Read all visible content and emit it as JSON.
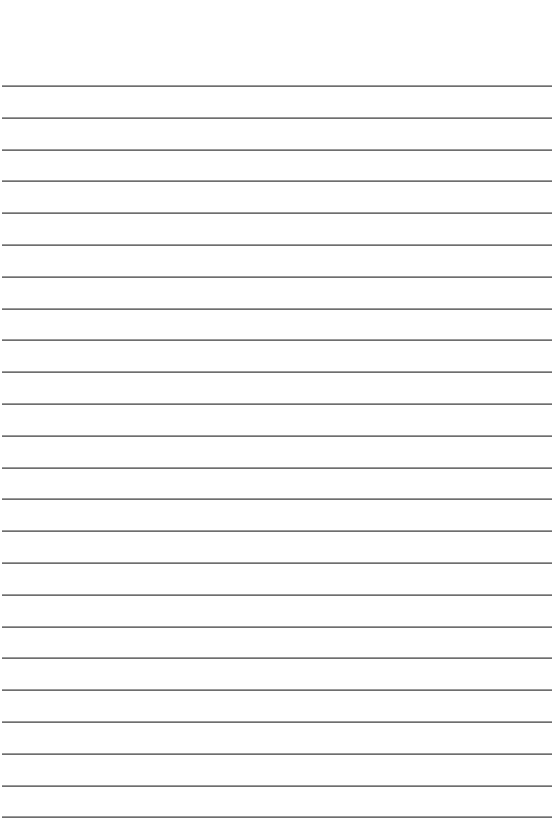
{
  "page": {
    "type": "lined-paper",
    "background_color": "#ffffff",
    "line_color": "#6e6e6e",
    "line_count": 24,
    "first_line_y": 85,
    "line_spacing": 31.8
  }
}
